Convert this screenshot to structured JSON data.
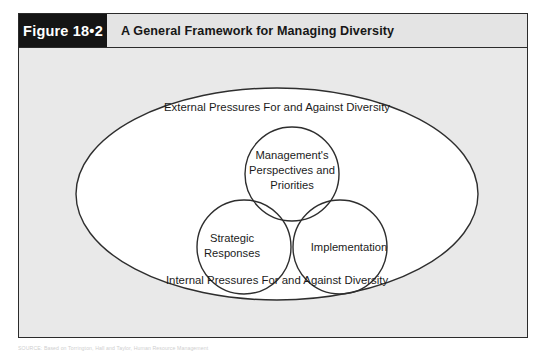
{
  "figure": {
    "number_label": "Figure 18•2",
    "title": "A General Framework for Managing Diversity"
  },
  "diagram": {
    "type": "venn-in-ellipse",
    "outer_ellipse": {
      "top_label": "External Pressures For and Against Diversity",
      "bottom_label": "Internal Pressures For and Against Diversity"
    },
    "circles": [
      {
        "name": "management-perspectives",
        "lines": [
          "Management's",
          "Perspectives and",
          "Priorities"
        ]
      },
      {
        "name": "strategic-responses",
        "lines": [
          "Strategic",
          "Responses"
        ]
      },
      {
        "name": "implementation",
        "lines": [
          "Implementation"
        ]
      }
    ],
    "colors": {
      "outline": "#2e2e2e",
      "shape_fill": "#ffffff",
      "panel_background": "#e9e9e9",
      "header_background": "#e4e4e4",
      "number_box_background": "#151515",
      "number_box_text": "#ffffff"
    }
  },
  "source": {
    "caption": "SOURCE: Based on Torrington, Hall and Taylor, Human Resource Management"
  }
}
